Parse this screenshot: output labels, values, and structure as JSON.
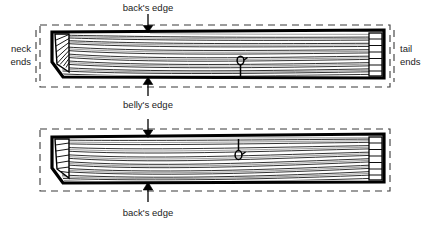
{
  "figure": {
    "title_visible": false,
    "background_color": "#ffffff",
    "ink_color": "#000000",
    "text_color": "#222222",
    "type": "technical-line-drawing"
  },
  "labels": {
    "top_arrow_top": "back's edge",
    "top_arrow_bottom": "belly's edge",
    "bottom_arrow_bottom": "back's edge",
    "left_line1": "neck",
    "left_line2": "ends",
    "right_line1": "tail",
    "right_line2": "ends"
  },
  "panels": [
    {
      "id": "upper-billet",
      "name": "upper-billet",
      "dashed_box": {
        "x": 40,
        "y": 25,
        "w": 350,
        "h": 62
      },
      "billet_outline": [
        [
          52,
          32
        ],
        [
          384,
          30
        ],
        [
          384,
          78
        ],
        [
          62,
          77
        ],
        [
          52,
          62
        ]
      ],
      "grain_direction": "run-out toward neck end (left), grain sweeps down-left",
      "end_grain_block_left": true,
      "end_grain_block_right": true,
      "knot_marker": {
        "x": 241,
        "y": 62,
        "symbol": "knot-pin"
      },
      "arrows": [
        {
          "name": "backs-edge-arrow",
          "x": 148,
          "from_y": 14,
          "to_y": 31,
          "direction": "down"
        },
        {
          "name": "bellys-edge-arrow",
          "x": 148,
          "from_y": 96,
          "to_y": 78,
          "direction": "up"
        }
      ]
    },
    {
      "id": "lower-billet",
      "name": "lower-billet",
      "dashed_box": {
        "x": 40,
        "y": 129,
        "w": 350,
        "h": 62
      },
      "billet_outline": [
        [
          52,
          137
        ],
        [
          384,
          134
        ],
        [
          384,
          182
        ],
        [
          62,
          183
        ],
        [
          52,
          168
        ]
      ],
      "grain_direction": "grain sweeps up from neck end, flatter toward tail",
      "end_grain_block_left": true,
      "end_grain_block_right": true,
      "knot_marker": {
        "x": 239,
        "y": 155,
        "symbol": "knot-pin"
      },
      "arrows": [
        {
          "name": "backs-edge-arrow-lower",
          "x": 148,
          "from_y": 119,
          "to_y": 137,
          "direction": "down"
        },
        {
          "name": "backs-edge-arrow-bottom",
          "x": 148,
          "from_y": 200,
          "to_y": 183,
          "direction": "up"
        }
      ]
    }
  ],
  "label_positions": {
    "top_arrow_top": {
      "x": 148,
      "y": 11,
      "anchor": "middle"
    },
    "top_arrow_bottom": {
      "x": 148,
      "y": 108,
      "anchor": "middle"
    },
    "bottom_arrow_bottom": {
      "x": 148,
      "y": 214,
      "anchor": "middle"
    },
    "left_line1": {
      "x": 31,
      "y": 52,
      "anchor": "end"
    },
    "left_line2": {
      "x": 31,
      "y": 65,
      "anchor": "end"
    },
    "right_line1": {
      "x": 400,
      "y": 52,
      "anchor": "start"
    },
    "right_line2": {
      "x": 400,
      "y": 65,
      "anchor": "start"
    }
  }
}
